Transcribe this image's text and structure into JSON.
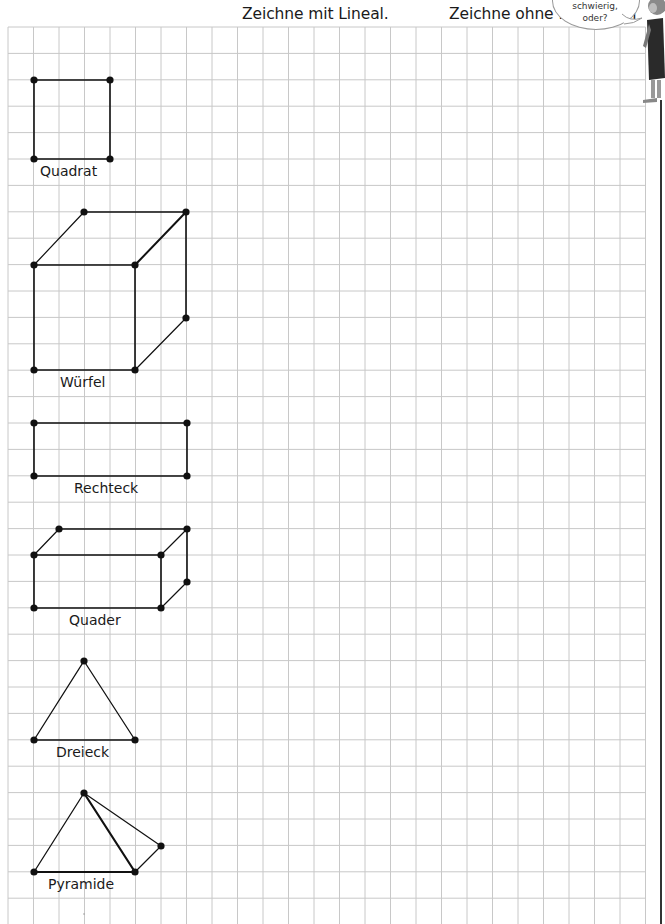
{
  "headings": {
    "with_ruler": "Zeichne mit Lineal.",
    "without_tools": "Zeichne ohne Hilfsmittel"
  },
  "speech_bubble": {
    "line1": "schwierig,",
    "line2": "oder?"
  },
  "grid": {
    "left": 8,
    "top": 27,
    "cell_width": 25.5,
    "cell_height": 26.4,
    "columns": 25,
    "rows": 34,
    "line_color": "#c8c8c8"
  },
  "shapes": [
    {
      "name": "Quadrat",
      "label": "Quadrat"
    },
    {
      "name": "Wuerfel",
      "label": "Würfel"
    },
    {
      "name": "Rechteck",
      "label": "Rechteck"
    },
    {
      "name": "Quader",
      "label": "Quader"
    },
    {
      "name": "Dreieck",
      "label": "Dreieck"
    },
    {
      "name": "Pyramide",
      "label": "Pyramide"
    }
  ],
  "colors": {
    "ink": "#111111",
    "grid": "#c8c8c8"
  }
}
